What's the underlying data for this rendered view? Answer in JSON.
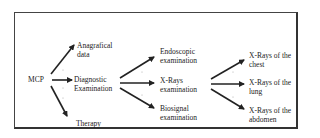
{
  "diagram": {
    "type": "flow-tree",
    "root": {
      "id": "mcp",
      "label": "MCP"
    },
    "nodes": [
      {
        "id": "anagrafical",
        "line1": "Anagrafical",
        "line2": "data",
        "level": 1
      },
      {
        "id": "diagnostic",
        "line1": "Diagnostic",
        "line2": "Examination",
        "level": 1
      },
      {
        "id": "therapy",
        "line1": "Therapy",
        "line2": "",
        "level": 1
      },
      {
        "id": "endoscopic",
        "line1": "Endoscopic",
        "line2": "examination",
        "level": 2
      },
      {
        "id": "xrays",
        "line1": "X-Rays",
        "line2": "examination",
        "level": 2
      },
      {
        "id": "biosignal",
        "line1": "Biosignal",
        "line2": "examination",
        "level": 2
      },
      {
        "id": "xr_chest",
        "line1": "X-Rays of the",
        "line2": "chest",
        "level": 3
      },
      {
        "id": "xr_lung",
        "line1": "X-Rays of the",
        "line2": "lung",
        "level": 3
      },
      {
        "id": "xr_abdomen",
        "line1": "X-Rays of the",
        "line2": "abdomen",
        "level": 3
      }
    ],
    "edges": [
      {
        "from": "mcp",
        "to": "anagrafical"
      },
      {
        "from": "mcp",
        "to": "diagnostic"
      },
      {
        "from": "mcp",
        "to": "therapy"
      },
      {
        "from": "diagnostic",
        "to": "endoscopic"
      },
      {
        "from": "diagnostic",
        "to": "xrays"
      },
      {
        "from": "diagnostic",
        "to": "biosignal"
      },
      {
        "from": "xrays",
        "to": "xr_chest"
      },
      {
        "from": "xrays",
        "to": "xr_lung"
      },
      {
        "from": "xrays",
        "to": "xr_abdomen"
      }
    ],
    "colors": {
      "line": "#222222",
      "frame": "#333333",
      "background": "#ffffff"
    }
  }
}
